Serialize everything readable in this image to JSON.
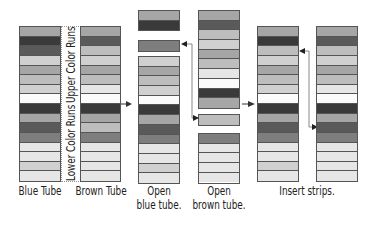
{
  "palette": {
    "white": "#fbfbfb",
    "lighter": "#e6e6e6",
    "light": "#d0d0d0",
    "midlight": "#bdbdbd",
    "mid": "#a6a6a6",
    "middark": "#7e7e7e",
    "dark": "#5a5a5a",
    "darkest": "#3a3a3a",
    "border": "#555555",
    "arrow": "#333333"
  },
  "bracket": {
    "upper_label": "Upper Color Runs",
    "lower_label": "Lower Color Runs"
  },
  "tubes": [
    {
      "id": "blue-tube",
      "label_lines": [
        "Blue Tube"
      ],
      "stripes": [
        "mid",
        "darkest",
        "dark",
        "light",
        "mid",
        "midlight",
        "light",
        "white",
        "darkest",
        "mid",
        "dark",
        "middark",
        "lighter",
        "lighter",
        "light",
        "lighter"
      ]
    },
    {
      "id": "brown-tube",
      "label_lines": [
        "Brown Tube"
      ],
      "stripes": [
        "mid",
        "dark",
        "midlight",
        "light",
        "mid",
        "midlight",
        "lighter",
        "white",
        "darkest",
        "mid",
        "midlight",
        "middark",
        "lighter",
        "lighter",
        "lighter",
        "lighter"
      ]
    },
    {
      "id": "open-blue-tube",
      "label_lines": [
        "Open",
        "blue tube."
      ],
      "segments": [
        {
          "stripes": [
            "mid",
            "darkest"
          ]
        },
        {
          "stripes": [
            "middark"
          ],
          "removed": true
        },
        {
          "stripes": [
            "light",
            "mid",
            "midlight",
            "light",
            "white",
            "darkest",
            "mid",
            "dark",
            "middark",
            "lighter",
            "lighter",
            "light",
            "lighter"
          ]
        }
      ]
    },
    {
      "id": "open-brown-tube",
      "label_lines": [
        "Open",
        "brown tube."
      ],
      "segments": [
        {
          "stripes": [
            "mid",
            "dark",
            "midlight",
            "light",
            "mid",
            "midlight",
            "lighter",
            "white",
            "darkest",
            "mid"
          ]
        },
        {
          "stripes": [
            "midlight"
          ],
          "removed": true
        },
        {
          "stripes": [
            "middark",
            "lighter",
            "lighter",
            "lighter",
            "lighter"
          ]
        }
      ]
    },
    {
      "id": "insert-blue-result",
      "label_lines": [
        "Insert strips."
      ],
      "stripes": [
        "mid",
        "darkest",
        "midlight",
        "light",
        "mid",
        "midlight",
        "light",
        "white",
        "darkest",
        "mid",
        "dark",
        "middark",
        "lighter",
        "lighter",
        "light",
        "lighter"
      ]
    },
    {
      "id": "insert-brown-result",
      "stripes": [
        "mid",
        "dark",
        "midlight",
        "light",
        "mid",
        "midlight",
        "lighter",
        "white",
        "darkest",
        "mid",
        "dark",
        "middark",
        "lighter",
        "lighter",
        "lighter",
        "lighter"
      ]
    }
  ]
}
